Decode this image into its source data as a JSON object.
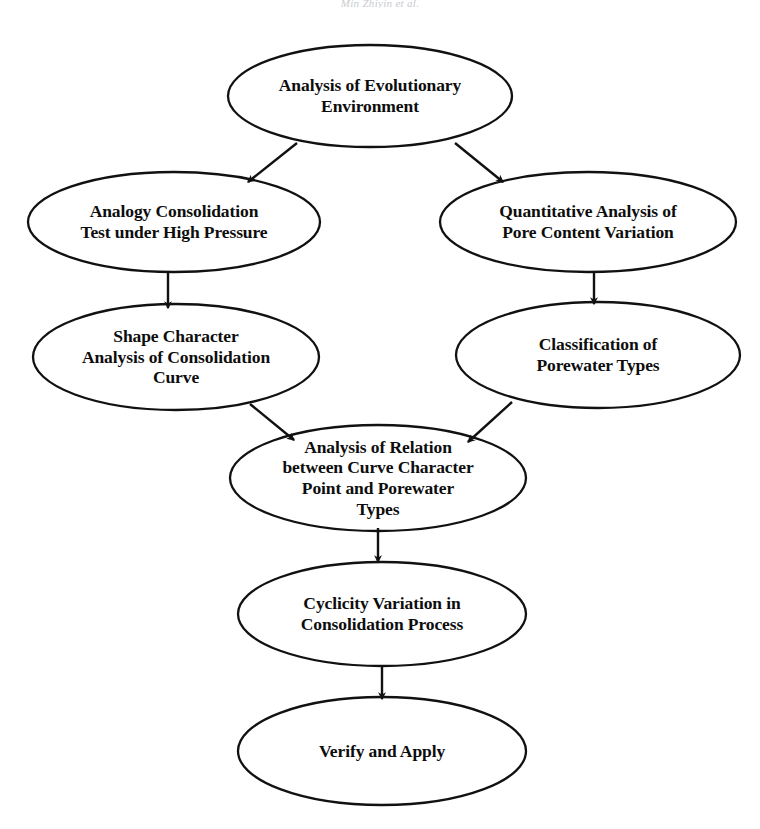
{
  "figure": {
    "kind": "flowchart",
    "title_fragment": "Min Zhiyin et al.",
    "background_color": "#ffffff",
    "stroke_color": "#111111",
    "text_color": "#0d0d0d"
  },
  "nodes": [
    {
      "id": "analysis-of-evolutionary-environment",
      "label": "Analysis of Evolutionary\nEnvironment",
      "shape": "ellipse",
      "cx": 370,
      "cy": 96,
      "rx": 142,
      "ry": 51
    },
    {
      "id": "analogy-consolidation-test-under-high-pressure",
      "label": "Analogy Consolidation\nTest under High Pressure",
      "shape": "ellipse",
      "cx": 174,
      "cy": 222,
      "rx": 146,
      "ry": 50
    },
    {
      "id": "quantitative-analysis-of-pore-content-variation",
      "label": "Quantitative Analysis of\nPore Content Variation",
      "shape": "ellipse",
      "cx": 588,
      "cy": 222,
      "rx": 148,
      "ry": 50
    },
    {
      "id": "shape-character-analysis-of-consolidation-curve",
      "label": "Shape Character\nAnalysis of Consolidation\nCurve",
      "shape": "ellipse",
      "cx": 176,
      "cy": 357,
      "rx": 143,
      "ry": 53
    },
    {
      "id": "classification-of-porewater-types",
      "label": "Classification of\nPorewater Types",
      "shape": "ellipse",
      "cx": 598,
      "cy": 355,
      "rx": 142,
      "ry": 53
    },
    {
      "id": "analysis-of-relation-between-curve-character-point-and-porewater-types",
      "label": "Analysis of Relation\nbetween Curve Character\nPoint and Porewater\nTypes",
      "shape": "ellipse",
      "cx": 378,
      "cy": 478,
      "rx": 148,
      "ry": 53
    },
    {
      "id": "cyclicity-variation-in-consolidation-process",
      "label": "Cyclicity Variation in\nConsolidation Process",
      "shape": "ellipse",
      "cx": 382,
      "cy": 614,
      "rx": 144,
      "ry": 52
    },
    {
      "id": "verify-and-apply",
      "label": "Verify and Apply",
      "shape": "ellipse",
      "cx": 382,
      "cy": 751,
      "rx": 144,
      "ry": 54
    }
  ],
  "edges": [
    {
      "id": "edge-root-to-left",
      "from": "analysis-of-evolutionary-environment",
      "to": "analogy-consolidation-test-under-high-pressure",
      "style": "diagonal-arrow",
      "x1": 297,
      "y1": 143,
      "x2": 248,
      "y2": 182
    },
    {
      "id": "edge-root-to-right",
      "from": "analysis-of-evolutionary-environment",
      "to": "quantitative-analysis-of-pore-content-variation",
      "style": "diagonal-arrow",
      "x1": 455,
      "y1": 143,
      "x2": 503,
      "y2": 182
    },
    {
      "id": "edge-left-down",
      "from": "analogy-consolidation-test-under-high-pressure",
      "to": "shape-character-analysis-of-consolidation-curve",
      "style": "vertical-arrow",
      "x1": 168,
      "y1": 272,
      "x2": 168,
      "y2": 308
    },
    {
      "id": "edge-right-down",
      "from": "quantitative-analysis-of-pore-content-variation",
      "to": "classification-of-porewater-types",
      "style": "vertical-arrow",
      "x1": 594,
      "y1": 272,
      "x2": 594,
      "y2": 304
    },
    {
      "id": "edge-left-to-merge",
      "from": "shape-character-analysis-of-consolidation-curve",
      "to": "analysis-of-relation-between-curve-character-point-and-porewater-types",
      "style": "diagonal-arrow",
      "x1": 250,
      "y1": 404,
      "x2": 294,
      "y2": 440
    },
    {
      "id": "edge-right-to-merge",
      "from": "classification-of-porewater-types",
      "to": "analysis-of-relation-between-curve-character-point-and-porewater-types",
      "style": "diagonal-arrow",
      "x1": 512,
      "y1": 402,
      "x2": 468,
      "y2": 442
    },
    {
      "id": "edge-merge-to-cyclicity",
      "from": "analysis-of-relation-between-curve-character-point-and-porewater-types",
      "to": "cyclicity-variation-in-consolidation-process",
      "style": "vertical-arrow",
      "x1": 378,
      "y1": 528,
      "x2": 378,
      "y2": 562
    },
    {
      "id": "edge-cyclicity-to-verify",
      "from": "cyclicity-variation-in-consolidation-process",
      "to": "verify-and-apply",
      "style": "vertical-arrow",
      "x1": 382,
      "y1": 665,
      "x2": 382,
      "y2": 699
    }
  ]
}
